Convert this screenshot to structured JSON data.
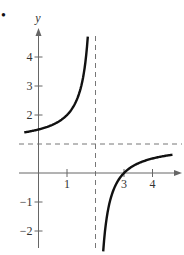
{
  "bullet": "•",
  "chart_data": {
    "type": "line",
    "title": "",
    "xlabel": "",
    "ylabel": "y",
    "xlim": [
      -0.5,
      4.8
    ],
    "ylim": [
      -2.7,
      4.9
    ],
    "x_ticks": [
      1,
      3,
      4
    ],
    "x_tick_labels": [
      "1",
      "3",
      "4"
    ],
    "y_ticks": [
      4,
      3,
      2,
      -1,
      -2
    ],
    "y_tick_labels": [
      "4",
      "3",
      "2",
      "−1",
      "−2"
    ],
    "grid": false,
    "legend": null,
    "function": "y = (x - 3)/(x - 2)",
    "asymptotes": {
      "vertical": 2,
      "horizontal": 1
    },
    "series": [
      {
        "name": "left-branch",
        "x": [
          -0.5,
          0,
          0.5,
          1,
          1.25,
          1.5,
          1.6,
          1.7,
          1.73
        ],
        "y": [
          1.4,
          1.5,
          1.67,
          2,
          2.33,
          3,
          3.5,
          4.33,
          4.75
        ]
      },
      {
        "name": "right-branch",
        "x": [
          2.27,
          2.4,
          2.5,
          2.75,
          3,
          3.5,
          4,
          4.7
        ],
        "y": [
          -2.7,
          -1.5,
          -1,
          -0.33,
          0,
          0.33,
          0.5,
          0.63
        ]
      }
    ],
    "annotations": [
      "x-intercept at 3",
      "y-intercept at 1.5"
    ]
  }
}
